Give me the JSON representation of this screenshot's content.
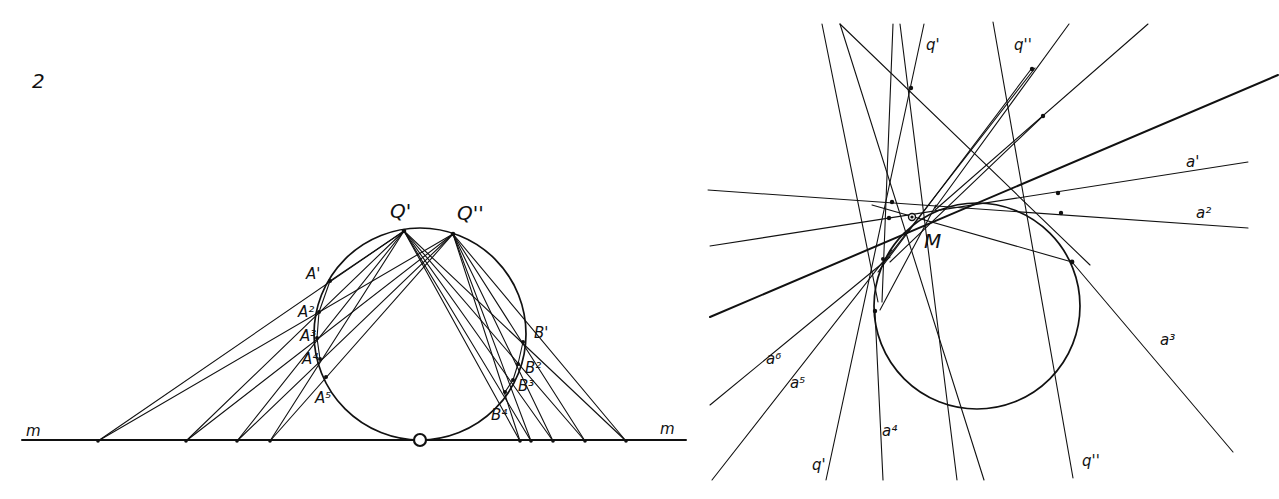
{
  "figure": {
    "number": "2",
    "left_panel": {
      "line_label_left": "m",
      "line_label_right": "m",
      "points_top": [
        "Q'",
        "Q''"
      ],
      "points_A": [
        "A'",
        "A²",
        "A³",
        "A⁴",
        "A⁵"
      ],
      "points_B": [
        "B'",
        "B²",
        "B³",
        "B⁴"
      ]
    },
    "right_panel": {
      "center_label": "M",
      "top_labels": [
        "q'",
        "q''"
      ],
      "bottom_labels": [
        "q'",
        "q''"
      ],
      "tangent_labels": [
        "a'",
        "a²",
        "a³",
        "a⁴",
        "a⁵",
        "a⁶"
      ]
    }
  },
  "colors": {
    "ink": "#111111",
    "paper": "#ffffff"
  }
}
